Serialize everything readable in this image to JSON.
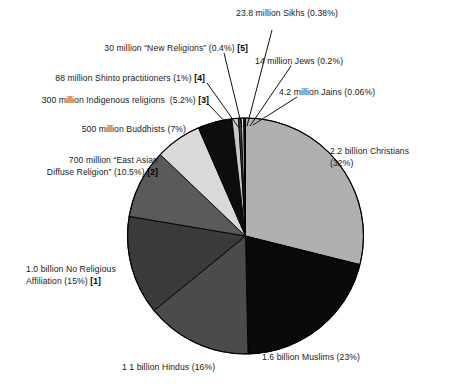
{
  "chart_data": {
    "type": "pie",
    "title": "",
    "subtitle": "",
    "xlabel": "",
    "ylabel": "",
    "legend_position": "none",
    "grid": false,
    "categories": [
      "Christians",
      "Muslims",
      "Hindus",
      "No Religious Affiliation",
      "East Asian Diffuse Religion",
      "Buddhists",
      "Indigenous religions",
      "Shinto practitioners",
      "New Religions",
      "Sikhs",
      "Jews",
      "Jains"
    ],
    "values": [
      32,
      23,
      16,
      15,
      10.5,
      7,
      5.2,
      1,
      0.4,
      0.38,
      0.2,
      0.06
    ],
    "counts": [
      "2.2 billion",
      "1.6 billion",
      "1 1 billion",
      "1.0 billion",
      "700 million",
      "500 million",
      "300 million",
      "88 million",
      "30 million",
      "23.8 million",
      "14 million",
      "4.2 million"
    ],
    "colors": [
      "#b0b0b0",
      "#0a0a0a",
      "#4b4b4b",
      "#3a3a3a",
      "#5a5a5a",
      "#d9d9d9",
      "#0d0d0d",
      "#c9c9c9",
      "#3d3d3d",
      "#e2e2e2",
      "#2b2b2b",
      "#8a8a8a"
    ],
    "footnote_markers": [
      "",
      "",
      "",
      "[1]",
      "[2]",
      "",
      "[3]",
      "[4]",
      "[5]",
      "",
      "",
      ""
    ],
    "start_angle_deg": 0,
    "direction": "clockwise"
  },
  "labels": {
    "sikhs": {
      "text": "23.8 million Sikhs (0.38%)",
      "marker": ""
    },
    "new_religions": {
      "text": "30 million “New Religions” (0.4%) ",
      "marker": "[5]"
    },
    "jews": {
      "text": "14 million Jews (0.2%)",
      "marker": ""
    },
    "shinto": {
      "text": "88 million Shinto practitioners (1%) ",
      "marker": "[4]"
    },
    "indigenous": {
      "text": "300 million Indigenous religions  (5.2%) ",
      "marker": "[3]"
    },
    "jains": {
      "text": "4.2 million Jains (0.06%)",
      "marker": ""
    },
    "buddhists": {
      "text": "500 million Buddhists (7%)",
      "marker": ""
    },
    "east_asian_line1": {
      "text": "700 million “East Asian"
    },
    "east_asian_line2": {
      "text": "Diffuse Religion” (10.5%) ",
      "marker": "[2]"
    },
    "christians_line1": {
      "text": "2.2 billion Christians"
    },
    "christians_line2": {
      "text": "(32%)"
    },
    "no_affiliation_line1": {
      "text": "1.0 billion No Religious"
    },
    "no_affiliation_line2": {
      "text": "Affiliation (15%) ",
      "marker": "[1]"
    },
    "muslims": {
      "text": "1.6 billion Muslims (23%)",
      "marker": ""
    },
    "hindus": {
      "text": "1 1 billion Hindus (16%)",
      "marker": ""
    }
  },
  "style": {
    "background": "#ffffff",
    "text_color": "#191919",
    "leader_line_color": "#111111",
    "pie_outline": "#000000"
  }
}
